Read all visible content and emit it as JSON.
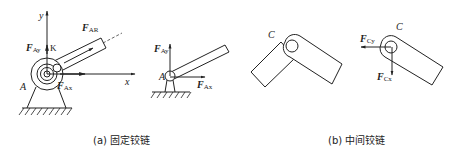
{
  "figure_a": {
    "caption": "(a) 固定铰链",
    "left": {
      "axis_y": "y",
      "axis_x": "x",
      "point_label": "A",
      "point_k": "K",
      "force_ay": {
        "main": "F",
        "sub": "Ay"
      },
      "force_ax": {
        "main": "F",
        "sub": "Ax"
      },
      "force_ar": {
        "main": "F",
        "sub": "AR"
      }
    },
    "right": {
      "point_label": "A",
      "force_ay": {
        "main": "F",
        "sub": "Ay"
      },
      "force_ax": {
        "main": "F",
        "sub": "Ax"
      }
    }
  },
  "figure_b": {
    "caption": "(b) 中间铰链",
    "left": {
      "point_label": "C"
    },
    "right": {
      "point_label": "C",
      "force_cy": {
        "main": "F",
        "sub": "Cy"
      },
      "force_cx": {
        "main": "F",
        "sub": "Cx"
      }
    }
  },
  "colors": {
    "line": "#222222",
    "background": "#ffffff"
  }
}
